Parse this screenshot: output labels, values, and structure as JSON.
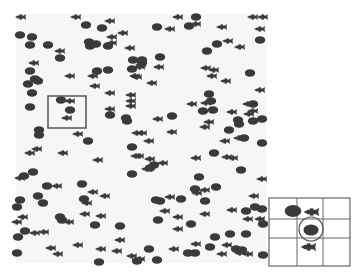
{
  "colors": {
    "page_bg": "#ffffff",
    "field_bg": "#f6f6f6",
    "shape": "#3a3a3a",
    "frame": "#555555",
    "grid": "#666666"
  },
  "field": {
    "x": 16,
    "y": 14,
    "w": 250,
    "h": 249
  },
  "highlight_box": {
    "x": 48,
    "y": 96,
    "w": 38,
    "h": 32
  },
  "blobs": [
    [
      86,
      25
    ],
    [
      102,
      28
    ],
    [
      20,
      35
    ],
    [
      32,
      37
    ],
    [
      30,
      45
    ],
    [
      48,
      45
    ],
    [
      89,
      42
    ],
    [
      96,
      44
    ],
    [
      90,
      46
    ],
    [
      108,
      46
    ],
    [
      60,
      58
    ],
    [
      133,
      60
    ],
    [
      132,
      69
    ],
    [
      30,
      71
    ],
    [
      97,
      71
    ],
    [
      108,
      70
    ],
    [
      35,
      79
    ],
    [
      38,
      81
    ],
    [
      28,
      84
    ],
    [
      32,
      93
    ],
    [
      196,
      17
    ],
    [
      157,
      27
    ],
    [
      189,
      26
    ],
    [
      217,
      44
    ],
    [
      207,
      51
    ],
    [
      260,
      40
    ],
    [
      160,
      57
    ],
    [
      142,
      60
    ],
    [
      142,
      63
    ],
    [
      250,
      73
    ],
    [
      30,
      107
    ],
    [
      61,
      100
    ],
    [
      70,
      110
    ],
    [
      110,
      115
    ],
    [
      126,
      118
    ],
    [
      127,
      121
    ],
    [
      39,
      130
    ],
    [
      39,
      135
    ],
    [
      88,
      141
    ],
    [
      132,
      147
    ],
    [
      33,
      172
    ],
    [
      24,
      176
    ],
    [
      132,
      174
    ],
    [
      209,
      94
    ],
    [
      211,
      101
    ],
    [
      203,
      111
    ],
    [
      213,
      110
    ],
    [
      253,
      104
    ],
    [
      172,
      116
    ],
    [
      238,
      120
    ],
    [
      239,
      124
    ],
    [
      229,
      130
    ],
    [
      253,
      121
    ],
    [
      262,
      119
    ],
    [
      244,
      138
    ],
    [
      262,
      143
    ],
    [
      214,
      153
    ],
    [
      154,
      165
    ],
    [
      150,
      168
    ],
    [
      241,
      170
    ],
    [
      47,
      186
    ],
    [
      82,
      184
    ],
    [
      20,
      200
    ],
    [
      38,
      196
    ],
    [
      43,
      203
    ],
    [
      84,
      199
    ],
    [
      17,
      207
    ],
    [
      60,
      217
    ],
    [
      62,
      220
    ],
    [
      95,
      225
    ],
    [
      120,
      226
    ],
    [
      25,
      231
    ],
    [
      18,
      237
    ],
    [
      17,
      253
    ],
    [
      137,
      261
    ],
    [
      99,
      262
    ],
    [
      199,
      177
    ],
    [
      195,
      189
    ],
    [
      216,
      187
    ],
    [
      156,
      200
    ],
    [
      160,
      201
    ],
    [
      181,
      199
    ],
    [
      205,
      201
    ],
    [
      246,
      211
    ],
    [
      255,
      207
    ],
    [
      262,
      209
    ],
    [
      158,
      220
    ],
    [
      191,
      224
    ],
    [
      263,
      224
    ],
    [
      215,
      237
    ],
    [
      230,
      234
    ],
    [
      246,
      234
    ],
    [
      149,
      249
    ],
    [
      210,
      247
    ],
    [
      236,
      249
    ],
    [
      188,
      253
    ],
    [
      195,
      253
    ],
    [
      242,
      250
    ],
    [
      263,
      255
    ],
    [
      157,
      260
    ]
  ],
  "fish": [
    [
      21,
      17
    ],
    [
      76,
      17
    ],
    [
      110,
      21
    ],
    [
      112,
      37
    ],
    [
      123,
      33
    ],
    [
      112,
      43
    ],
    [
      60,
      51
    ],
    [
      130,
      48
    ],
    [
      34,
      63
    ],
    [
      70,
      76
    ],
    [
      93,
      76
    ],
    [
      135,
      76
    ],
    [
      95,
      86
    ],
    [
      178,
      17
    ],
    [
      253,
      17
    ],
    [
      263,
      17
    ],
    [
      170,
      29
    ],
    [
      196,
      24
    ],
    [
      222,
      27
    ],
    [
      260,
      29
    ],
    [
      228,
      41
    ],
    [
      240,
      47
    ],
    [
      141,
      65
    ],
    [
      140,
      67
    ],
    [
      159,
      67
    ],
    [
      206,
      68
    ],
    [
      214,
      70
    ],
    [
      212,
      76
    ],
    [
      226,
      81
    ],
    [
      152,
      83
    ],
    [
      137,
      77
    ],
    [
      260,
      90
    ],
    [
      70,
      101
    ],
    [
      67,
      118
    ],
    [
      110,
      93
    ],
    [
      131,
      95
    ],
    [
      131,
      101
    ],
    [
      131,
      106
    ],
    [
      110,
      109
    ],
    [
      78,
      134
    ],
    [
      137,
      133
    ],
    [
      37,
      149
    ],
    [
      30,
      153
    ],
    [
      63,
      153
    ],
    [
      136,
      156
    ],
    [
      98,
      160
    ],
    [
      192,
      104
    ],
    [
      206,
      103
    ],
    [
      232,
      112
    ],
    [
      248,
      104
    ],
    [
      253,
      111
    ],
    [
      249,
      114
    ],
    [
      158,
      119
    ],
    [
      209,
      122
    ],
    [
      205,
      127
    ],
    [
      142,
      133
    ],
    [
      172,
      132
    ],
    [
      149,
      141
    ],
    [
      225,
      141
    ],
    [
      239,
      138
    ],
    [
      139,
      156
    ],
    [
      150,
      159
    ],
    [
      196,
      158
    ],
    [
      227,
      157
    ],
    [
      233,
      158
    ],
    [
      163,
      163
    ],
    [
      147,
      169
    ],
    [
      262,
      179
    ],
    [
      20,
      178
    ],
    [
      57,
      186
    ],
    [
      93,
      192
    ],
    [
      87,
      203
    ],
    [
      105,
      196
    ],
    [
      85,
      214
    ],
    [
      101,
      216
    ],
    [
      23,
      217
    ],
    [
      17,
      222
    ],
    [
      69,
      222
    ],
    [
      35,
      233
    ],
    [
      44,
      232
    ],
    [
      120,
      240
    ],
    [
      78,
      245
    ],
    [
      51,
      248
    ],
    [
      101,
      249
    ],
    [
      117,
      251
    ],
    [
      58,
      254
    ],
    [
      132,
      256
    ],
    [
      205,
      190
    ],
    [
      197,
      193
    ],
    [
      170,
      197
    ],
    [
      254,
      196
    ],
    [
      165,
      211
    ],
    [
      232,
      210
    ],
    [
      205,
      214
    ],
    [
      178,
      217
    ],
    [
      248,
      219
    ],
    [
      260,
      219
    ],
    [
      178,
      229
    ],
    [
      196,
      244
    ],
    [
      227,
      245
    ],
    [
      174,
      249
    ],
    [
      240,
      253
    ],
    [
      222,
      254
    ],
    [
      248,
      254
    ],
    [
      140,
      259
    ]
  ],
  "inset": {
    "x": 269,
    "y": 198,
    "w": 81,
    "h": 68,
    "col_lines": [
      297,
      323
    ],
    "row_lines": [
      219,
      238
    ],
    "blob": [
      293,
      211
    ],
    "fish_top": [
      312,
      212
    ],
    "circle": {
      "cx": 311,
      "cy": 229,
      "r": 12
    },
    "circled_blob": [
      311,
      230
    ],
    "fish_bottom": [
      309,
      247
    ]
  }
}
